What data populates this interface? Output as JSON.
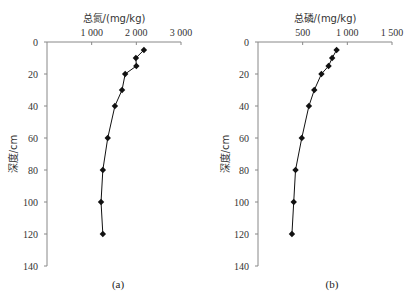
{
  "chart_data": [
    {
      "type": "line",
      "panel_label": "(a)",
      "title": "",
      "xlabel": "总氮/(mg/kg)",
      "ylabel": "深度/cm",
      "x_axis_position": "top",
      "y_axis_inverted": true,
      "xlim": [
        0,
        3000
      ],
      "ylim": [
        0,
        140
      ],
      "xticks": [
        1000,
        2000,
        3000
      ],
      "xtick_labels": [
        "1 000",
        "2 000",
        "3 000"
      ],
      "yticks": [
        0,
        20,
        40,
        60,
        80,
        100,
        120,
        140
      ],
      "ytick_labels": [
        "0",
        "20",
        "40",
        "60",
        "80",
        "100",
        "120",
        "140"
      ],
      "grid": false,
      "marker": "diamond",
      "series": [
        {
          "name": "总氮",
          "depth": [
            5,
            10,
            15,
            20,
            30,
            40,
            60,
            80,
            100,
            120
          ],
          "values": [
            2170,
            1990,
            2000,
            1750,
            1680,
            1520,
            1360,
            1250,
            1210,
            1250
          ]
        }
      ]
    },
    {
      "type": "line",
      "panel_label": "(b)",
      "title": "",
      "xlabel": "总磷/(mg/kg)",
      "ylabel": "深度/cm",
      "x_axis_position": "top",
      "y_axis_inverted": true,
      "xlim": [
        0,
        1500
      ],
      "ylim": [
        0,
        140
      ],
      "xticks": [
        500,
        1000,
        1500
      ],
      "xtick_labels": [
        "500",
        "1 000",
        "1 500"
      ],
      "yticks": [
        0,
        20,
        40,
        60,
        80,
        100,
        120,
        140
      ],
      "ytick_labels": [
        "0",
        "20",
        "40",
        "60",
        "80",
        "100",
        "120",
        "140"
      ],
      "grid": false,
      "marker": "diamond",
      "series": [
        {
          "name": "总磷",
          "depth": [
            5,
            10,
            15,
            20,
            30,
            40,
            60,
            80,
            100,
            120
          ],
          "values": [
            880,
            830,
            790,
            710,
            630,
            570,
            490,
            420,
            400,
            380
          ]
        }
      ]
    }
  ]
}
